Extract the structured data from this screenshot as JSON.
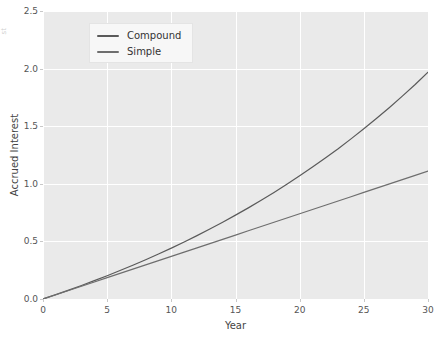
{
  "chart_data": {
    "type": "line",
    "title": "",
    "xlabel": "Year",
    "ylabel": "Accrued Interest",
    "xlim": [
      0,
      30
    ],
    "ylim": [
      0.0,
      2.5
    ],
    "xticks": [
      "0",
      "5",
      "10",
      "15",
      "20",
      "25",
      "30"
    ],
    "xtick_values": [
      0,
      5,
      10,
      15,
      20,
      25,
      30
    ],
    "yticks": [
      "0.0",
      "0.5",
      "1.0",
      "1.5",
      "2.0",
      "2.5"
    ],
    "ytick_values": [
      0.0,
      0.5,
      1.0,
      1.5,
      2.0,
      2.5
    ],
    "grid": true,
    "legend_position": "upper left",
    "x": [
      0,
      1,
      2,
      3,
      4,
      5,
      6,
      7,
      8,
      9,
      10,
      11,
      12,
      13,
      14,
      15,
      16,
      17,
      18,
      19,
      20,
      21,
      22,
      23,
      24,
      25,
      26,
      27,
      28,
      29,
      30
    ],
    "series": [
      {
        "name": "Compound",
        "color": "#5a5a5a",
        "values": [
          0.0,
          0.038,
          0.077,
          0.117,
          0.159,
          0.202,
          0.247,
          0.293,
          0.341,
          0.391,
          0.442,
          0.495,
          0.55,
          0.607,
          0.666,
          0.728,
          0.791,
          0.857,
          0.925,
          0.996,
          1.069,
          1.145,
          1.224,
          1.305,
          1.39,
          1.478,
          1.569,
          1.663,
          1.761,
          1.862,
          1.968
        ]
      },
      {
        "name": "Simple",
        "color": "#6e6e6e",
        "values": [
          0.0,
          0.037,
          0.074,
          0.111,
          0.148,
          0.185,
          0.222,
          0.259,
          0.296,
          0.333,
          0.37,
          0.407,
          0.444,
          0.481,
          0.518,
          0.555,
          0.592,
          0.629,
          0.666,
          0.703,
          0.74,
          0.777,
          0.814,
          0.851,
          0.888,
          0.925,
          0.962,
          0.999,
          1.036,
          1.073,
          1.11
        ]
      }
    ]
  },
  "figure": {
    "background_color": "#ffffff",
    "axes_background_color": "#eaeaea",
    "gridline_color": "#ffffff",
    "edge_glyph": "st"
  },
  "legend": {
    "entries": [
      {
        "label": "Compound",
        "color": "#5a5a5a"
      },
      {
        "label": "Simple",
        "color": "#6e6e6e"
      }
    ]
  }
}
